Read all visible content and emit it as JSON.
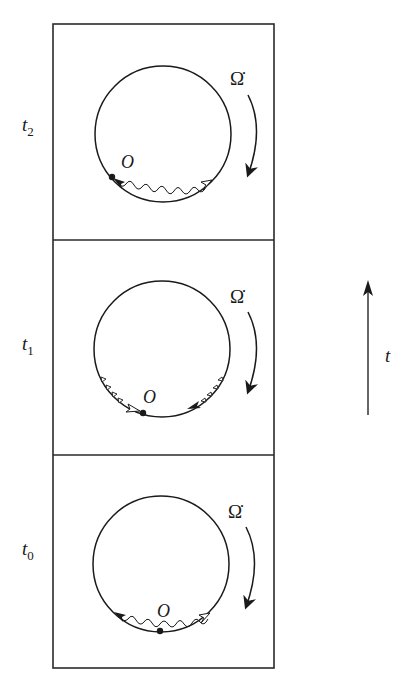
{
  "diagram": {
    "type": "time-sequence of rotating circle frames",
    "time_axis": {
      "label": "t",
      "direction": "up"
    },
    "rotation_label": "Ω̇",
    "rotation_direction": "clockwise",
    "panels": [
      {
        "id": "t2",
        "time_label": "t",
        "time_sub": "2",
        "point_label": "O",
        "point_position": "lower-left of circle",
        "description": "wavy signal along lower arc from O (solid arrow at O) to open arrow at lower right"
      },
      {
        "id": "t1",
        "time_label": "t",
        "time_sub": "1",
        "point_label": "O",
        "point_position": "bottom of circle, slightly left",
        "description": "two signal pulses converging: open arrow from left arriving at O, solid arrow from right"
      },
      {
        "id": "t0",
        "time_label": "t",
        "time_sub": "0",
        "point_label": "O",
        "point_position": "bottom of circle",
        "description": "wavy signals emitted from O in both directions: solid arrow to left, open arrow to right"
      }
    ]
  }
}
